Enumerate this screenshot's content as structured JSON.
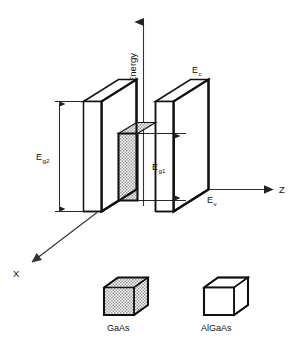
{
  "figure": {
    "background_color": "#ffffff",
    "line_color": "#111111",
    "shade_color": "#c8c8c8"
  },
  "axes": {
    "vertical": {
      "name": "energy-axis",
      "label": "Energy",
      "orientation": "vertical",
      "arrow": "up"
    },
    "depth": {
      "name": "z-axis",
      "label": "Z",
      "orientation": "horizontal",
      "arrow": "right"
    },
    "lateral": {
      "name": "x-axis",
      "label": "X",
      "orientation": "diagonal",
      "arrow": "down-left"
    }
  },
  "band_edges": {
    "conduction": {
      "symbol": "E",
      "subscript": "c",
      "full": "Ec"
    },
    "valence": {
      "symbol": "E",
      "subscript": "v",
      "full": "Ev"
    }
  },
  "bandgaps": [
    {
      "name": "barrier-bandgap",
      "symbol": "E",
      "subscript": "g2",
      "full": "Eg2",
      "material": "AlGaAs",
      "arrow": "double-headed"
    },
    {
      "name": "well-bandgap",
      "symbol": "E",
      "subscript": "g1",
      "full": "Eg1",
      "material": "GaAs",
      "arrow": "double-headed"
    }
  ],
  "legend": {
    "items": [
      {
        "name": "legend-gaas",
        "label": "GaAs",
        "fill": "shaded",
        "shape": "cube"
      },
      {
        "name": "legend-algaas",
        "label": "AlGaAs",
        "fill": "white",
        "shape": "cube"
      }
    ]
  },
  "structure": {
    "slabs": [
      {
        "name": "left-barrier-slab",
        "material": "AlGaAs",
        "fill": "white"
      },
      {
        "name": "right-barrier-slab",
        "material": "AlGaAs",
        "fill": "white"
      }
    ],
    "well": {
      "name": "quantum-well-region",
      "material": "GaAs",
      "fill": "shaded"
    }
  }
}
